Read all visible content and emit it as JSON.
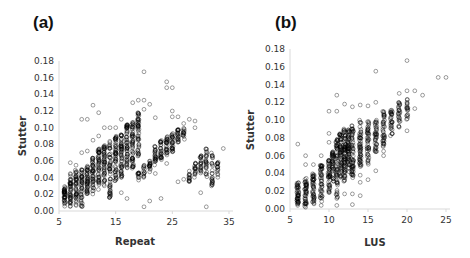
{
  "chart_data": [
    {
      "type": "scatter",
      "panel_label": "(a)",
      "title": "",
      "xlabel": "Repeat",
      "ylabel": "Stutter",
      "xlim": [
        5,
        35
      ],
      "ylim": [
        0,
        0.18
      ],
      "xticks": [
        "5",
        "15",
        "25",
        "35"
      ],
      "yticks": [
        "0.00",
        "0.02",
        "0.04",
        "0.06",
        "0.08",
        "0.10",
        "0.12",
        "0.14",
        "0.16",
        "0.18"
      ],
      "grid": false,
      "legend": null,
      "marker": "open-circle",
      "columns": [
        {
          "x": 6,
          "low": 0.005,
          "high": 0.03,
          "n": 40
        },
        {
          "x": 7,
          "low": 0.005,
          "high": 0.045,
          "n": 45
        },
        {
          "x": 8,
          "low": 0.005,
          "high": 0.05,
          "n": 45
        },
        {
          "x": 9,
          "low": 0.003,
          "high": 0.05,
          "n": 45
        },
        {
          "x": 10,
          "low": 0.02,
          "high": 0.055,
          "n": 45
        },
        {
          "x": 11,
          "low": 0.02,
          "high": 0.065,
          "n": 45
        },
        {
          "x": 12,
          "low": 0.025,
          "high": 0.075,
          "n": 50
        },
        {
          "x": 13,
          "low": 0.03,
          "high": 0.08,
          "n": 50
        },
        {
          "x": 14,
          "low": 0.015,
          "high": 0.085,
          "n": 55
        },
        {
          "x": 15,
          "low": 0.035,
          "high": 0.09,
          "n": 55
        },
        {
          "x": 16,
          "low": 0.04,
          "high": 0.095,
          "n": 55
        },
        {
          "x": 17,
          "low": 0.05,
          "high": 0.105,
          "n": 55
        },
        {
          "x": 18,
          "low": 0.05,
          "high": 0.11,
          "n": 55
        },
        {
          "x": 19,
          "low": 0.06,
          "high": 0.118,
          "n": 50
        },
        {
          "x": 19,
          "low": 0.035,
          "high": 0.048,
          "n": 12
        },
        {
          "x": 20,
          "low": 0.04,
          "high": 0.055,
          "n": 14
        },
        {
          "x": 21,
          "low": 0.045,
          "high": 0.06,
          "n": 18
        },
        {
          "x": 22,
          "low": 0.055,
          "high": 0.078,
          "n": 25
        },
        {
          "x": 23,
          "low": 0.06,
          "high": 0.085,
          "n": 28
        },
        {
          "x": 24,
          "low": 0.065,
          "high": 0.09,
          "n": 28
        },
        {
          "x": 25,
          "low": 0.07,
          "high": 0.095,
          "n": 28
        },
        {
          "x": 26,
          "low": 0.08,
          "high": 0.098,
          "n": 22
        },
        {
          "x": 27,
          "low": 0.085,
          "high": 0.1,
          "n": 14
        },
        {
          "x": 28,
          "low": 0.035,
          "high": 0.05,
          "n": 14
        },
        {
          "x": 29,
          "low": 0.04,
          "high": 0.058,
          "n": 18
        },
        {
          "x": 30,
          "low": 0.045,
          "high": 0.068,
          "n": 22
        },
        {
          "x": 31,
          "low": 0.04,
          "high": 0.075,
          "n": 26
        },
        {
          "x": 32,
          "low": 0.03,
          "high": 0.07,
          "n": 26
        },
        {
          "x": 33,
          "low": 0.04,
          "high": 0.062,
          "n": 16
        }
      ],
      "outliers": [
        [
          20,
          0.167
        ],
        [
          24,
          0.155
        ],
        [
          24,
          0.148
        ],
        [
          25,
          0.148
        ],
        [
          19,
          0.133
        ],
        [
          20,
          0.133
        ],
        [
          21,
          0.128
        ],
        [
          18,
          0.13
        ],
        [
          20,
          0.122
        ],
        [
          22,
          0.112
        ],
        [
          25,
          0.12
        ],
        [
          25,
          0.113
        ],
        [
          26,
          0.113
        ],
        [
          27,
          0.105
        ],
        [
          28,
          0.11
        ],
        [
          29,
          0.108
        ],
        [
          11,
          0.127
        ],
        [
          12,
          0.118
        ],
        [
          9,
          0.11
        ],
        [
          10,
          0.11
        ],
        [
          13,
          0.1
        ],
        [
          14,
          0.1
        ],
        [
          34,
          0.075
        ],
        [
          29,
          0.1
        ],
        [
          24,
          0.057
        ],
        [
          22,
          0.045
        ],
        [
          21,
          0.012
        ],
        [
          23,
          0.015
        ],
        [
          20,
          0.005
        ],
        [
          26,
          0.035
        ],
        [
          31,
          0.005
        ],
        [
          30,
          0.022
        ],
        [
          17,
          0.015
        ],
        [
          16,
          0.022
        ],
        [
          27,
          0.038
        ],
        [
          7,
          0.058
        ],
        [
          8,
          0.055
        ],
        [
          10,
          0.072
        ],
        [
          9,
          0.07
        ],
        [
          11,
          0.085
        ],
        [
          12,
          0.09
        ],
        [
          15,
          0.1
        ],
        [
          16,
          0.11
        ]
      ]
    },
    {
      "type": "scatter",
      "panel_label": "(b)",
      "title": "",
      "xlabel": "LUS",
      "ylabel": "Stutter",
      "xlim": [
        5,
        25
      ],
      "ylim": [
        0,
        0.18
      ],
      "xticks": [
        "5",
        "10",
        "15",
        "20",
        "25"
      ],
      "yticks": [
        "0.00",
        "0.02",
        "0.04",
        "0.06",
        "0.08",
        "0.10",
        "0.12",
        "0.14",
        "0.16",
        "0.18"
      ],
      "grid": false,
      "legend": null,
      "marker": "open-circle",
      "columns": [
        {
          "x": 6,
          "low": 0.004,
          "high": 0.03,
          "n": 45
        },
        {
          "x": 7,
          "low": 0.003,
          "high": 0.035,
          "n": 45
        },
        {
          "x": 8,
          "low": 0.005,
          "high": 0.04,
          "n": 45
        },
        {
          "x": 9,
          "low": 0.008,
          "high": 0.05,
          "n": 45
        },
        {
          "x": 10,
          "low": 0.015,
          "high": 0.055,
          "n": 45
        },
        {
          "x": 10.5,
          "low": 0.03,
          "high": 0.065,
          "n": 40
        },
        {
          "x": 11,
          "low": 0.01,
          "high": 0.08,
          "n": 60
        },
        {
          "x": 11.5,
          "low": 0.035,
          "high": 0.085,
          "n": 60
        },
        {
          "x": 12,
          "low": 0.03,
          "high": 0.09,
          "n": 70
        },
        {
          "x": 12.5,
          "low": 0.04,
          "high": 0.09,
          "n": 60
        },
        {
          "x": 13,
          "low": 0.035,
          "high": 0.095,
          "n": 60
        },
        {
          "x": 14,
          "low": 0.045,
          "high": 0.1,
          "n": 55
        },
        {
          "x": 15,
          "low": 0.05,
          "high": 0.1,
          "n": 45
        },
        {
          "x": 16,
          "low": 0.06,
          "high": 0.1,
          "n": 40
        },
        {
          "x": 17,
          "low": 0.07,
          "high": 0.11,
          "n": 40
        },
        {
          "x": 18,
          "low": 0.08,
          "high": 0.112,
          "n": 30
        },
        {
          "x": 19,
          "low": 0.09,
          "high": 0.12,
          "n": 25
        },
        {
          "x": 20,
          "low": 0.1,
          "high": 0.125,
          "n": 18
        }
      ],
      "outliers": [
        [
          20,
          0.167
        ],
        [
          16,
          0.155
        ],
        [
          24,
          0.148
        ],
        [
          25,
          0.148
        ],
        [
          20,
          0.133
        ],
        [
          21,
          0.133
        ],
        [
          22,
          0.128
        ],
        [
          19,
          0.13
        ],
        [
          20,
          0.12
        ],
        [
          21,
          0.113
        ],
        [
          16,
          0.12
        ],
        [
          15,
          0.116
        ],
        [
          13,
          0.115
        ],
        [
          14,
          0.117
        ],
        [
          11,
          0.128
        ],
        [
          10,
          0.11
        ],
        [
          11,
          0.11
        ],
        [
          12,
          0.118
        ],
        [
          6,
          0.073
        ],
        [
          7,
          0.06
        ],
        [
          7,
          0.05
        ],
        [
          13,
          0.005
        ],
        [
          11,
          0.004
        ],
        [
          9,
          0.004
        ],
        [
          7,
          0.002
        ],
        [
          13,
          0.017
        ],
        [
          12,
          0.017
        ],
        [
          14,
          0.015
        ],
        [
          14,
          0.03
        ],
        [
          15,
          0.033
        ],
        [
          16,
          0.043
        ],
        [
          17,
          0.06
        ],
        [
          17,
          0.065
        ],
        [
          20,
          0.088
        ],
        [
          19,
          0.092
        ],
        [
          15,
          0.052
        ],
        [
          14,
          0.038
        ],
        [
          10,
          0.075
        ],
        [
          10,
          0.085
        ],
        [
          9,
          0.06
        ],
        [
          8,
          0.05
        ]
      ]
    }
  ]
}
